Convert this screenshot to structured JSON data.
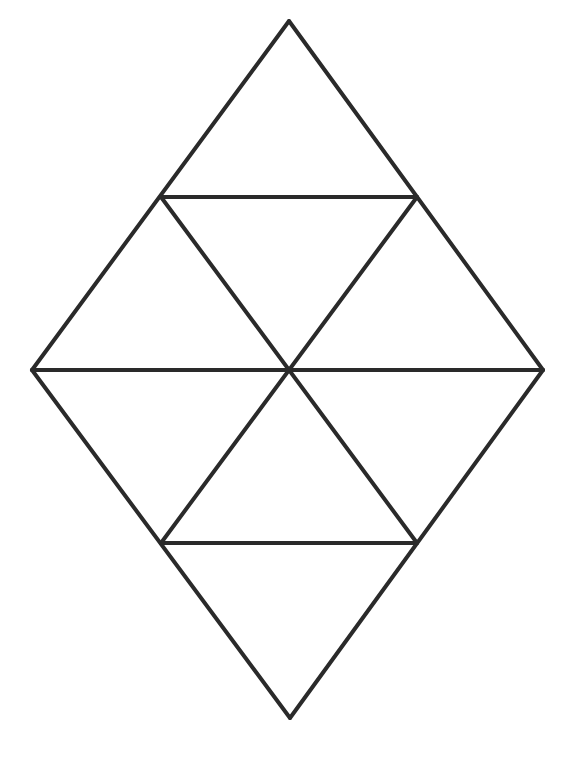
{
  "diagram": {
    "title": "",
    "stroke_color": "#2a2a2a",
    "stroke_width": 4,
    "background": "#ffffff",
    "vertices": {
      "top": [
        289,
        21
      ],
      "upper_left": [
        161,
        197
      ],
      "upper_right": [
        417,
        197
      ],
      "left": [
        32,
        370
      ],
      "center": [
        289,
        370
      ],
      "right": [
        543,
        370
      ],
      "lower_left": [
        161,
        543
      ],
      "lower_right": [
        417,
        543
      ],
      "bottom": [
        290,
        718
      ]
    },
    "segments": [
      {
        "id": "outer-top-left",
        "from": "top",
        "to": "left"
      },
      {
        "id": "outer-top-right",
        "from": "top",
        "to": "right"
      },
      {
        "id": "outer-bottom-left",
        "from": "left",
        "to": "bottom"
      },
      {
        "id": "outer-bottom-right",
        "from": "right",
        "to": "bottom"
      },
      {
        "id": "upper-horizontal",
        "from": "upper_left",
        "to": "upper_right"
      },
      {
        "id": "middle-horizontal",
        "from": "left",
        "to": "right"
      },
      {
        "id": "lower-horizontal",
        "from": "lower_left",
        "to": "lower_right"
      },
      {
        "id": "diag-ul-to-lr",
        "from": "upper_left",
        "to": "lower_right"
      },
      {
        "id": "diag-ur-to-ll",
        "from": "upper_right",
        "to": "lower_left"
      }
    ],
    "triangle_count_small": 8
  }
}
